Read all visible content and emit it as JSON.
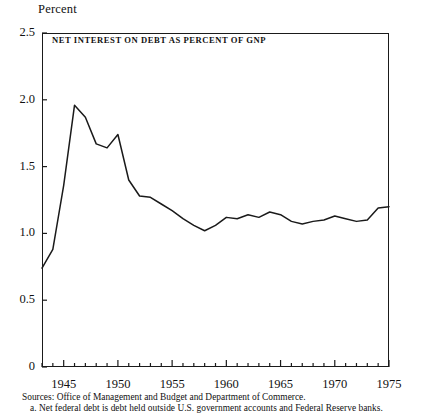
{
  "figure": {
    "y_axis_unit_label": "Percent",
    "chart_title": "NET INTEREST ON DEBT AS PERCENT OF GNP",
    "source_line": "Sources:  Office of Management and Budget and Department of Commerce.",
    "footnote_line": "a. Net federal debt is debt held outside U.S. government accounts and Federal Reserve banks.",
    "line_color": "#1a1a1a",
    "frame_color": "#1a1a1a",
    "background_color": "#ffffff"
  },
  "chart_data": {
    "type": "line",
    "title": "NET INTEREST ON DEBT AS PERCENT OF GNP",
    "xlabel": "",
    "ylabel": "Percent",
    "xlim": [
      1943,
      1975
    ],
    "ylim": [
      0,
      2.5
    ],
    "ytick_labels": [
      "0",
      "0.5",
      "1.0",
      "1.5",
      "2.0",
      "2.5"
    ],
    "ytick_values": [
      0,
      0.5,
      1.0,
      1.5,
      2.0,
      2.5
    ],
    "xtick_labels": [
      "1945",
      "1950",
      "1955",
      "1960",
      "1965",
      "1970",
      "1975"
    ],
    "xtick_values": [
      1945,
      1950,
      1955,
      1960,
      1965,
      1970,
      1975
    ],
    "minor_xticks_every": 1,
    "grid": false,
    "legend": "none",
    "x": [
      1943,
      1944,
      1945,
      1946,
      1947,
      1948,
      1949,
      1950,
      1951,
      1952,
      1953,
      1954,
      1955,
      1956,
      1957,
      1958,
      1959,
      1960,
      1961,
      1962,
      1963,
      1964,
      1965,
      1966,
      1967,
      1968,
      1969,
      1970,
      1971,
      1972,
      1973,
      1974,
      1975
    ],
    "values": [
      0.74,
      0.88,
      1.36,
      1.96,
      1.87,
      1.67,
      1.64,
      1.74,
      1.4,
      1.28,
      1.27,
      1.22,
      1.17,
      1.11,
      1.06,
      1.02,
      1.06,
      1.12,
      1.11,
      1.14,
      1.12,
      1.16,
      1.14,
      1.09,
      1.07,
      1.09,
      1.1,
      1.13,
      1.11,
      1.09,
      1.1,
      1.19,
      1.2
    ],
    "series_name": "Net interest on debt as percent of GNP",
    "annotations": [
      {
        "label": "peak",
        "x": 1946,
        "y": 1.96
      },
      {
        "label": "secondary peak",
        "x": 1950,
        "y": 1.74
      },
      {
        "label": "trough",
        "x": 1958,
        "y": 1.02
      }
    ]
  }
}
